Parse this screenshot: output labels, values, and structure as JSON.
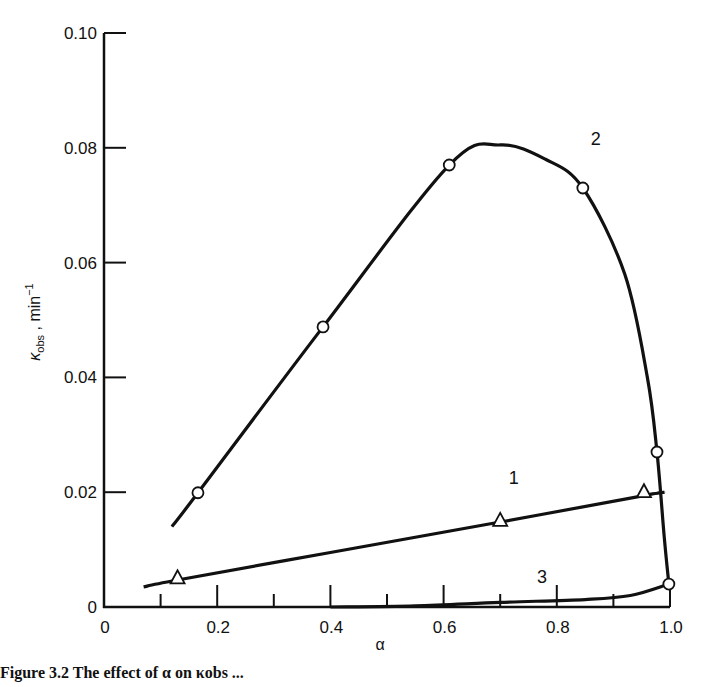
{
  "chart_data": {
    "type": "line",
    "title": "",
    "xlabel": "α",
    "ylabel": "κobs , min⁻¹",
    "ylabel_parts": {
      "main": "κ",
      "sub": "obs",
      "rest": " , min",
      "sup": "−1"
    },
    "xlim": [
      0,
      1.0
    ],
    "ylim": [
      0,
      0.1
    ],
    "x_ticks": [
      "0",
      "0.2",
      "0.4",
      "0.6",
      "0.8",
      "1.0"
    ],
    "y_ticks": [
      "0",
      "0.02",
      "0.04",
      "0.06",
      "0.08",
      "0.10"
    ],
    "x_minor_ticks": [
      0.1,
      0.3,
      0.5,
      0.7,
      0.9
    ],
    "grid": false,
    "legend": "inline curve labels",
    "series": [
      {
        "name": "1",
        "marker": "triangle",
        "points": [
          [
            0.13,
            0.005
          ],
          [
            0.7,
            0.015
          ],
          [
            0.954,
            0.02
          ]
        ],
        "curve": [
          [
            0.07,
            0.0035
          ],
          [
            0.13,
            0.0047
          ],
          [
            0.4,
            0.0095
          ],
          [
            0.7,
            0.0148
          ],
          [
            0.954,
            0.0194
          ],
          [
            0.99,
            0.02
          ]
        ]
      },
      {
        "name": "2",
        "marker": "circle",
        "points": [
          [
            0.166,
            0.0199
          ],
          [
            0.387,
            0.0488
          ],
          [
            0.61,
            0.077
          ],
          [
            0.846,
            0.073
          ],
          [
            0.977,
            0.027
          ],
          [
            0.998,
            0.004
          ]
        ],
        "curve": [
          [
            0.12,
            0.014
          ],
          [
            0.166,
            0.0199
          ],
          [
            0.387,
            0.0488
          ],
          [
            0.61,
            0.077
          ],
          [
            0.7,
            0.0805
          ],
          [
            0.78,
            0.078
          ],
          [
            0.846,
            0.073
          ],
          [
            0.92,
            0.058
          ],
          [
            0.96,
            0.04
          ],
          [
            0.977,
            0.027
          ],
          [
            0.99,
            0.012
          ],
          [
            0.998,
            0.004
          ]
        ]
      },
      {
        "name": "3",
        "marker": "none",
        "curve": [
          [
            0.4,
            0.0
          ],
          [
            0.55,
            0.0002
          ],
          [
            0.7,
            0.0008
          ],
          [
            0.85,
            0.0013
          ],
          [
            0.93,
            0.002
          ],
          [
            0.998,
            0.004
          ]
        ]
      }
    ]
  },
  "caption": {
    "text": "Figure 3.2   The effect of α on κobs ..."
  }
}
